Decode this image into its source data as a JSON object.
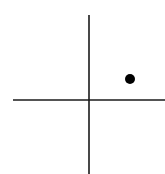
{
  "diagram": {
    "type": "coordinate-plane-point",
    "background": "#ffffff",
    "stroke_color": "#1a1a1a",
    "point_color": "#000000",
    "axes": {
      "x_axis": {
        "x1": 13,
        "y1": 100,
        "x2": 165,
        "y2": 100
      },
      "y_axis": {
        "x1": 89,
        "y1": 15,
        "x2": 89,
        "y2": 174
      }
    },
    "point": {
      "cx": 130,
      "cy": 79,
      "r": 5,
      "quadrant": "I"
    }
  }
}
